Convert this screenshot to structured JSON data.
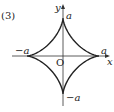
{
  "problem_number": "(3)",
  "axes": {
    "x_label": "x",
    "y_label": "y",
    "origin_label": "O"
  },
  "cusps": {
    "top": "a",
    "right": "a",
    "left": "−a",
    "bottom": "−a"
  },
  "curve": {
    "name": "astroid",
    "equation": "x^(2/3) + y^(2/3) = a^(2/3)"
  },
  "colors": {
    "curve": "#222222",
    "axes": "#333333"
  }
}
